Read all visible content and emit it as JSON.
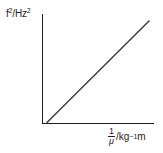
{
  "chart_data": {
    "type": "line",
    "title": "",
    "ylabel": "f²/Hz²",
    "ylabel_parts": {
      "base": "f",
      "exp": "2",
      "unit": "/Hz",
      "unit_exp": "2"
    },
    "xlabel": "1/μ /kg⁻¹ m",
    "xlabel_parts": {
      "numerator": "1",
      "denominator": "μ",
      "unit": "/kg",
      "unit_exp": "−1",
      "unit_tail": " m"
    },
    "series": [
      {
        "name": "f² vs 1/μ",
        "x": [
          0.04,
          0.96
        ],
        "y": [
          0.0,
          0.94
        ]
      }
    ],
    "xlim": [
      0,
      1
    ],
    "ylim": [
      0,
      1
    ],
    "grid": false,
    "legend": null,
    "ticks": {
      "x": [],
      "y": []
    },
    "colors": {
      "axis": "#231f20",
      "line": "#3a3a3a"
    }
  }
}
